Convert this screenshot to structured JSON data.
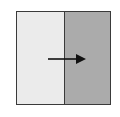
{
  "diagram": {
    "type": "split-square-with-arrow",
    "left_region": {
      "label": "",
      "fill": "#ebebeb"
    },
    "right_region": {
      "label": "",
      "fill": "#ababab"
    },
    "border_color": "#3a3a3a",
    "arrow": {
      "direction": "right",
      "color": "#111111",
      "icon": "arrow-right-icon"
    }
  }
}
